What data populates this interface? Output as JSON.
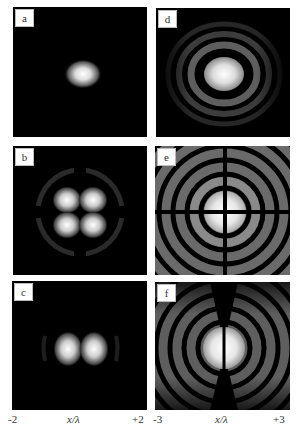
{
  "figure": {
    "panels": [
      {
        "id": "a",
        "label": "a",
        "pattern": "single-ellipse-spot"
      },
      {
        "id": "b",
        "label": "b",
        "pattern": "four-lobe-with-faint-rings"
      },
      {
        "id": "c",
        "label": "c",
        "pattern": "two-lobe-horizontal"
      },
      {
        "id": "d",
        "label": "d",
        "pattern": "central-spot-with-rings"
      },
      {
        "id": "e",
        "label": "e",
        "pattern": "four-lobe-with-strong-rings-cross-dark-lines"
      },
      {
        "id": "f",
        "label": "f",
        "pattern": "two-lobe-with-strong-rings-vertical-dark-line"
      }
    ],
    "left_axis": {
      "min": "-2",
      "label": "x/λ",
      "max": "+2"
    },
    "right_axis": {
      "min": "-3",
      "label": "x/λ",
      "max": "+3"
    }
  }
}
